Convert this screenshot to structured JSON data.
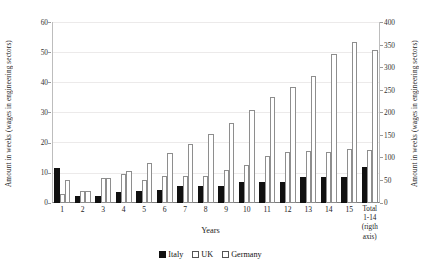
{
  "chart_data": {
    "type": "bar",
    "title": "",
    "xlabel": "Years",
    "ylabel": "Amount in weeks (wages in engineering sectors)",
    "ylabel_right": "Amount in weeks (wages in engineering sectors)",
    "categories": [
      "1",
      "2",
      "3",
      "4",
      "5",
      "6",
      "7",
      "8",
      "9",
      "10",
      "11",
      "12",
      "13",
      "14",
      "15",
      "Total 1-14 (rigth axis)"
    ],
    "category_labels": [
      {
        "lines": [
          "1"
        ]
      },
      {
        "lines": [
          "2"
        ]
      },
      {
        "lines": [
          "3"
        ]
      },
      {
        "lines": [
          "4"
        ]
      },
      {
        "lines": [
          "5"
        ]
      },
      {
        "lines": [
          "6"
        ]
      },
      {
        "lines": [
          "7"
        ]
      },
      {
        "lines": [
          "8"
        ]
      },
      {
        "lines": [
          "9"
        ]
      },
      {
        "lines": [
          "10"
        ]
      },
      {
        "lines": [
          "11"
        ]
      },
      {
        "lines": [
          "12"
        ]
      },
      {
        "lines": [
          "13"
        ]
      },
      {
        "lines": [
          "14"
        ]
      },
      {
        "lines": [
          "15"
        ]
      },
      {
        "lines": [
          "Total",
          "1-14",
          "(rigth",
          "axis)"
        ]
      }
    ],
    "series": [
      {
        "name": "Italy",
        "color": "#111111",
        "values": [
          11.5,
          2.2,
          2.3,
          3.6,
          4.0,
          4.2,
          5.5,
          5.8,
          5.6,
          7.0,
          7.1,
          7.0,
          8.5,
          8.6,
          8.5,
          11.8
        ]
      },
      {
        "name": "UK",
        "color": "#ffffff",
        "values": [
          3.0,
          3.9,
          8.3,
          9.6,
          7.6,
          9.0,
          9.1,
          9.0,
          11.0,
          12.5,
          15.5,
          16.9,
          17.2,
          17.0,
          17.8,
          17.5
        ]
      },
      {
        "name": "Germany",
        "color": "#ffffff",
        "values": [
          7.6,
          4.0,
          8.3,
          10.7,
          13.2,
          16.6,
          19.6,
          22.8,
          26.6,
          30.8,
          35.0,
          38.4,
          42.0,
          49.3,
          53.4,
          50.7
        ]
      }
    ],
    "ylim": [
      0,
      60
    ],
    "yticks": [
      0,
      10,
      20,
      30,
      40,
      50,
      60
    ],
    "ylim_right": [
      0,
      400
    ],
    "yticks_right": [
      0,
      50,
      100,
      150,
      200,
      250,
      300,
      350,
      400
    ],
    "grid": true,
    "legend": {
      "position": "bottom",
      "entries": [
        {
          "label": "Italy",
          "marker": "filled-square"
        },
        {
          "label": "UK",
          "marker": "open-square"
        },
        {
          "label": "Germany",
          "marker": "open-square"
        }
      ]
    }
  }
}
